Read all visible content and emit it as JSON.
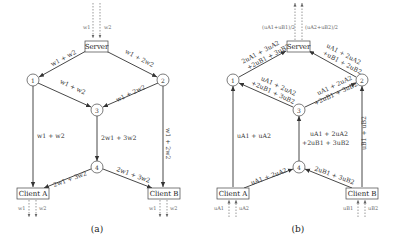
{
  "diagrams": [
    {
      "caption": "(a)",
      "nodes": {
        "server": "Server",
        "n1": "1",
        "n2": "2",
        "n3": "3",
        "n4": "4",
        "clientA": "Client A",
        "clientB": "Client B"
      },
      "inputs": {
        "server_left": "w1",
        "server_right": "w2"
      },
      "outputs": {
        "a_left": "w1",
        "a_right": "w2",
        "b_left": "w1",
        "b_right": "w2"
      },
      "edges": {
        "server_n1": "w1 + w2",
        "server_n2": "w1 + 2w2",
        "n1_n3": "w1 + w2",
        "n2_n3": "w1 + 2w2",
        "n1_clientA": "w1 + w2",
        "n3_n4": "2w1 + 3w2",
        "n2_clientB": "w1 + 2w2",
        "n4_clientA": "2w1 + 3w2",
        "n4_clientB": "2w1 + 3w2"
      }
    },
    {
      "caption": "(b)",
      "nodes": {
        "server": "Server",
        "n1": "1",
        "n2": "2",
        "n3": "3",
        "n4": "4",
        "clientA": "Client A",
        "clientB": "Client B"
      },
      "inputs": {
        "server_left": "(uA1+uB1)/2",
        "server_right": "(uA2+uB2)/2"
      },
      "outputs": {
        "a_left": "uA1",
        "a_right": "uA2",
        "b_left": "uB1",
        "b_right": "uB2"
      },
      "edges": {
        "n1_server": [
          "2uA1 + 3uA2",
          "+2uB1 + 3uB2"
        ],
        "n2_server": [
          "uA1 + 2uA2",
          "+uB1 + 2uB2"
        ],
        "n3_n1": [
          "uA1 + 2uA2",
          "+2uB1 + 3uB2"
        ],
        "n3_n2": [
          "uA1 + 2uA2",
          "+2uB1 + 3uB2"
        ],
        "clientA_n1": "uA1 + uA2",
        "n4_n3": [
          "uA1 + 2uA2",
          "+2uB1 + 3uB2"
        ],
        "clientB_n2": "uB1 + uB2",
        "clientA_n4": "uA1 + 2uA2",
        "clientB_n4": "2uB1 + 3uB2"
      }
    }
  ]
}
